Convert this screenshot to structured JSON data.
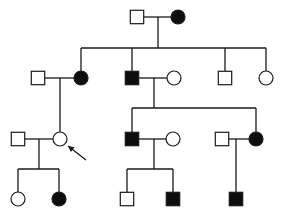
{
  "diagram": {
    "type": "pedigree",
    "colors": {
      "stroke": "#1a1a1a",
      "affected": "#0d0d0d",
      "unaffected": "#ffffff"
    },
    "individuals": [
      {
        "id": "I-1",
        "sex": "male",
        "affected": false,
        "x": 137,
        "y": 17
      },
      {
        "id": "I-2",
        "sex": "female",
        "affected": true,
        "x": 178,
        "y": 17
      },
      {
        "id": "II-1",
        "sex": "male",
        "affected": false,
        "x": 38,
        "y": 78
      },
      {
        "id": "II-2",
        "sex": "female",
        "affected": true,
        "x": 81,
        "y": 78
      },
      {
        "id": "II-3",
        "sex": "male",
        "affected": true,
        "x": 132,
        "y": 78
      },
      {
        "id": "II-4",
        "sex": "female",
        "affected": false,
        "x": 174,
        "y": 78
      },
      {
        "id": "II-5",
        "sex": "male",
        "affected": false,
        "x": 225,
        "y": 78
      },
      {
        "id": "II-6",
        "sex": "female",
        "affected": false,
        "x": 266,
        "y": 78
      },
      {
        "id": "III-1",
        "sex": "male",
        "affected": false,
        "x": 18,
        "y": 139
      },
      {
        "id": "III-2",
        "sex": "female",
        "affected": false,
        "x": 60,
        "y": 139,
        "proband": true
      },
      {
        "id": "III-3",
        "sex": "male",
        "affected": true,
        "x": 132,
        "y": 139
      },
      {
        "id": "III-4",
        "sex": "female",
        "affected": false,
        "x": 173,
        "y": 139
      },
      {
        "id": "III-5",
        "sex": "male",
        "affected": false,
        "x": 222,
        "y": 139
      },
      {
        "id": "III-6",
        "sex": "female",
        "affected": true,
        "x": 256,
        "y": 139
      },
      {
        "id": "IV-1",
        "sex": "female",
        "affected": false,
        "x": 18,
        "y": 199
      },
      {
        "id": "IV-2",
        "sex": "female",
        "affected": true,
        "x": 59,
        "y": 199
      },
      {
        "id": "IV-3",
        "sex": "male",
        "affected": false,
        "x": 127,
        "y": 199
      },
      {
        "id": "IV-4",
        "sex": "male",
        "affected": true,
        "x": 173,
        "y": 199
      },
      {
        "id": "IV-5",
        "sex": "male",
        "affected": true,
        "x": 236,
        "y": 199
      }
    ],
    "lines": [
      {
        "name": "couple-I",
        "x1": 144,
        "y1": 17,
        "x2": 171,
        "y2": 17
      },
      {
        "name": "descent-I",
        "x1": 158,
        "y1": 17,
        "x2": 158,
        "y2": 48
      },
      {
        "name": "sibship-II",
        "x1": 81,
        "y1": 48,
        "x2": 266,
        "y2": 48
      },
      {
        "name": "drop-II-2",
        "x1": 81,
        "y1": 48,
        "x2": 81,
        "y2": 71
      },
      {
        "name": "drop-II-3",
        "x1": 132,
        "y1": 48,
        "x2": 132,
        "y2": 71
      },
      {
        "name": "drop-II-5",
        "x1": 225,
        "y1": 48,
        "x2": 225,
        "y2": 71
      },
      {
        "name": "drop-II-6",
        "x1": 266,
        "y1": 48,
        "x2": 266,
        "y2": 71
      },
      {
        "name": "couple-II-left",
        "x1": 45,
        "y1": 78,
        "x2": 74,
        "y2": 78
      },
      {
        "name": "descent-II-left",
        "x1": 60,
        "y1": 78,
        "x2": 60,
        "y2": 132
      },
      {
        "name": "couple-II-mid",
        "x1": 139,
        "y1": 78,
        "x2": 167,
        "y2": 78
      },
      {
        "name": "descent-II-mid",
        "x1": 154,
        "y1": 78,
        "x2": 154,
        "y2": 108
      },
      {
        "name": "sibship-III-mid",
        "x1": 132,
        "y1": 108,
        "x2": 256,
        "y2": 108
      },
      {
        "name": "drop-III-3",
        "x1": 132,
        "y1": 108,
        "x2": 132,
        "y2": 132
      },
      {
        "name": "drop-III-6",
        "x1": 256,
        "y1": 108,
        "x2": 256,
        "y2": 132
      },
      {
        "name": "couple-III-left",
        "x1": 25,
        "y1": 139,
        "x2": 53,
        "y2": 139
      },
      {
        "name": "descent-III-left",
        "x1": 39,
        "y1": 139,
        "x2": 39,
        "y2": 169
      },
      {
        "name": "sibship-IV-left",
        "x1": 18,
        "y1": 169,
        "x2": 59,
        "y2": 169
      },
      {
        "name": "drop-IV-1",
        "x1": 18,
        "y1": 169,
        "x2": 18,
        "y2": 192
      },
      {
        "name": "drop-IV-2",
        "x1": 59,
        "y1": 169,
        "x2": 59,
        "y2": 192
      },
      {
        "name": "couple-III-mid",
        "x1": 139,
        "y1": 139,
        "x2": 166,
        "y2": 139
      },
      {
        "name": "descent-III-mid",
        "x1": 154,
        "y1": 139,
        "x2": 154,
        "y2": 169
      },
      {
        "name": "sibship-IV-mid",
        "x1": 127,
        "y1": 169,
        "x2": 173,
        "y2": 169
      },
      {
        "name": "drop-IV-3",
        "x1": 127,
        "y1": 169,
        "x2": 127,
        "y2": 192
      },
      {
        "name": "drop-IV-4",
        "x1": 173,
        "y1": 169,
        "x2": 173,
        "y2": 192
      },
      {
        "name": "couple-III-right",
        "x1": 229,
        "y1": 139,
        "x2": 249,
        "y2": 139
      },
      {
        "name": "descent-III-right",
        "x1": 236,
        "y1": 139,
        "x2": 236,
        "y2": 192
      }
    ],
    "proband_arrow": {
      "x1": 86,
      "y1": 160,
      "x2": 68,
      "y2": 146
    }
  }
}
